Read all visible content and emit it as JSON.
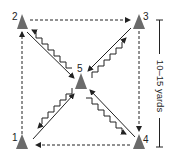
{
  "diagram": {
    "cones": [
      {
        "id": "1",
        "label": "1"
      },
      {
        "id": "2",
        "label": "2"
      },
      {
        "id": "3",
        "label": "3"
      },
      {
        "id": "4",
        "label": "4"
      },
      {
        "id": "5",
        "label": "5"
      }
    ],
    "dashed_paths": [
      {
        "from": "1",
        "to": "2"
      },
      {
        "from": "2",
        "to": "3"
      },
      {
        "from": "3",
        "to": "4"
      },
      {
        "from": "4",
        "to": "1"
      }
    ],
    "straight_paths": [
      {
        "from": "2",
        "to": "5"
      },
      {
        "from": "3",
        "to": "5"
      },
      {
        "from": "4",
        "to": "5"
      },
      {
        "from": "1",
        "to": "5"
      }
    ],
    "zigzag_paths": [
      {
        "from": "5",
        "to": "2"
      },
      {
        "from": "5",
        "to": "3"
      },
      {
        "from": "5",
        "to": "4"
      },
      {
        "from": "5",
        "to": "1"
      }
    ],
    "scale_label": "10–15 yards",
    "colors": {
      "cone": "#6b6b6b",
      "line": "#222222"
    }
  }
}
